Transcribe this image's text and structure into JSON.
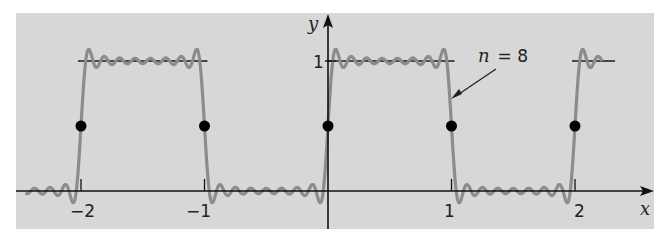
{
  "chart_data": {
    "type": "line",
    "title": "",
    "xlabel": "x",
    "ylabel": "y",
    "xlim": [
      -2.5,
      2.6
    ],
    "ylim": [
      -0.3,
      1.3
    ],
    "x_ticks": [
      -2,
      -1,
      1,
      2
    ],
    "x_tick_labels": [
      "−2",
      "−1",
      "1",
      "2"
    ],
    "y_ticks": [
      1
    ],
    "y_tick_labels": [
      "1"
    ],
    "grid": false,
    "background": "#d7d7d7",
    "series": [
      {
        "name": "Square wave f(x)",
        "style": "black segments",
        "segments": [
          {
            "x": [
              -2,
              -1
            ],
            "y": [
              1,
              1
            ]
          },
          {
            "x": [
              0,
              1
            ],
            "y": [
              1,
              1
            ]
          },
          {
            "x": [
              2,
              2.3
            ],
            "y": [
              1,
              1
            ]
          }
        ],
        "color": "#111111"
      },
      {
        "name": "Fourier partial sum",
        "annotation": "n = 8",
        "formula": "1/2 + (2/pi) * sum_{k=1..8} sin((2k-1) pi x)/(2k-1)",
        "x_range": [
          -2.45,
          2.22
        ],
        "color": "#8c8c8c"
      },
      {
        "name": "Midpoint values",
        "type": "scatter",
        "x": [
          -2,
          -1,
          0,
          1,
          2
        ],
        "y": [
          0.5,
          0.5,
          0.5,
          0.5,
          0.5
        ],
        "color": "#000000"
      }
    ],
    "annotations": [
      {
        "text": "n = 8",
        "arrow_to": {
          "x": 1.01,
          "y": 0.72
        }
      }
    ]
  },
  "labels": {
    "x_axis": "x",
    "y_axis": "y",
    "y_tick_1": "1",
    "x_tick_m2": "−2",
    "x_tick_m1": "−1",
    "x_tick_1": "1",
    "x_tick_2": "2",
    "annotation_n": "n",
    "annotation_eq": "= 8"
  }
}
